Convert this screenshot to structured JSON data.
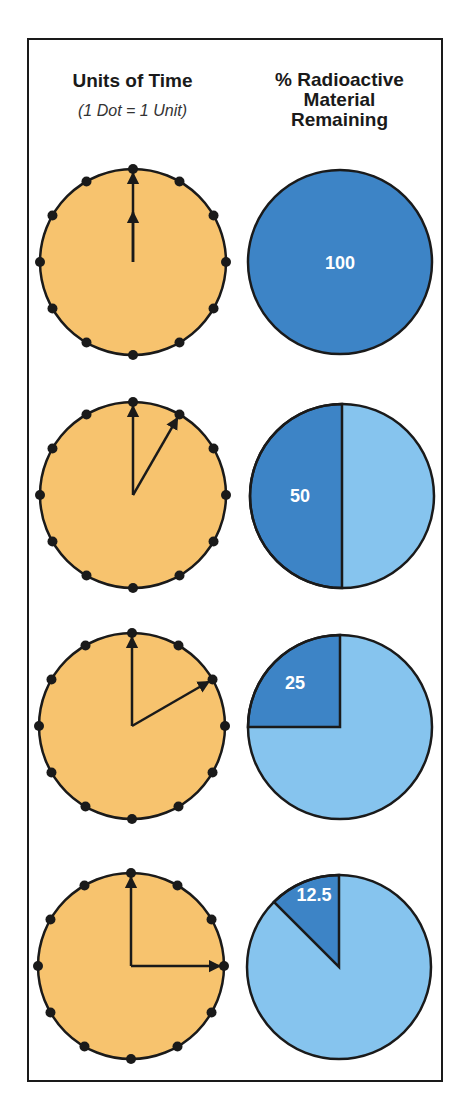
{
  "header": {
    "left_title": "Units of Time",
    "left_subtitle": "(1 Dot = 1 Unit)",
    "right_title_line1": "% Radioactive",
    "right_title_line2": "Material",
    "right_title_line3": "Remaining"
  },
  "colors": {
    "clock_face": "#f7c36e",
    "remaining": "#3d84c6",
    "decayed": "#86c4ee",
    "outline": "#1a1a1a",
    "label": "#ffffff"
  },
  "rows": [
    {
      "units_elapsed": 0,
      "percent_remaining": 100,
      "label": "100"
    },
    {
      "units_elapsed": 1,
      "percent_remaining": 50,
      "label": "50"
    },
    {
      "units_elapsed": 2,
      "percent_remaining": 25,
      "label": "25"
    },
    {
      "units_elapsed": 3,
      "percent_remaining": 12.5,
      "label": "12.5"
    }
  ],
  "chart_data": {
    "type": "pie",
    "dots_per_clock": 12,
    "x": [
      0,
      1,
      2,
      3
    ],
    "xlabel": "Units of Time (1 Dot = 1 Unit)",
    "values": [
      100,
      50,
      25,
      12.5
    ],
    "ylabel": "% Radioactive Material Remaining"
  }
}
